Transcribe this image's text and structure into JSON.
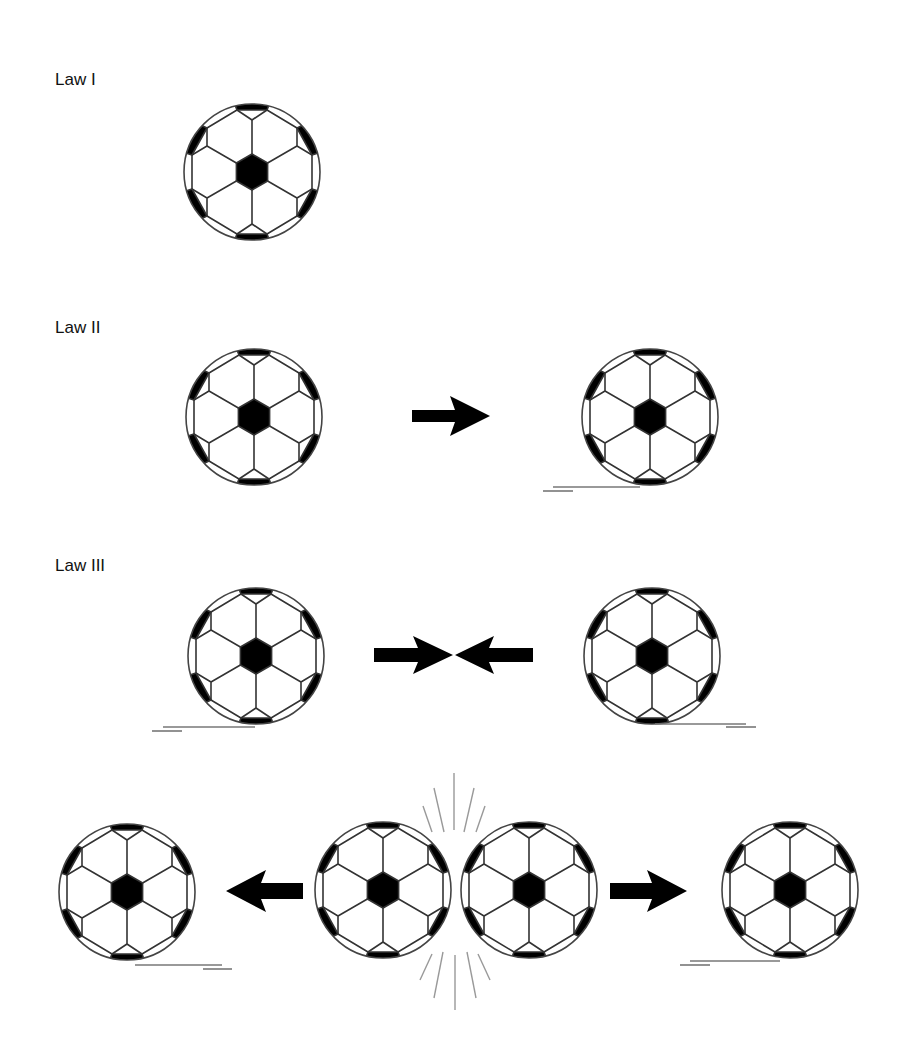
{
  "colors": {
    "ink": "#000000",
    "outline": "#555555",
    "motion_lines": "#777777",
    "impact_lines": "#999999",
    "background": "#ffffff"
  },
  "sections": [
    {
      "id": "law1",
      "label": "Law I",
      "description": "A ball at rest stays at rest"
    },
    {
      "id": "law2",
      "label": "Law II",
      "description": "A force applied to a ball makes it move"
    },
    {
      "id": "law3",
      "label": "Law III",
      "description": "Two balls collide and push each other apart"
    }
  ],
  "icons": {
    "ball": "soccer-ball-icon",
    "arrow": "arrow-icon",
    "motion": "motion-lines",
    "impact": "impact-lines"
  }
}
